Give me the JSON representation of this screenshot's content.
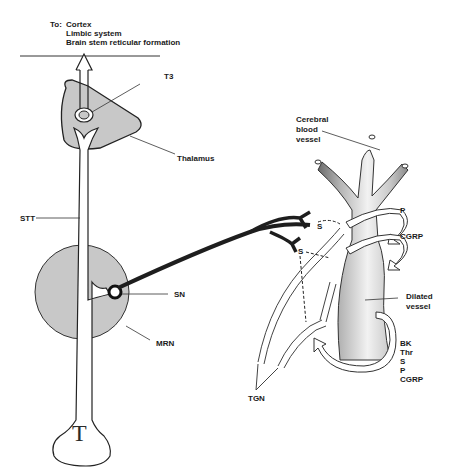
{
  "figure": {
    "destination": {
      "prefix": "To:",
      "targets": [
        "Cortex",
        "Limbic system",
        "Brain stem reticular formation"
      ]
    },
    "labels": {
      "t3": "T3",
      "thalamus": "Thalamus",
      "stt": "STT",
      "sn": "SN",
      "mrn": "MRN",
      "t_body": "T",
      "cerebral_vessel": [
        "Cerebral",
        "blood",
        "vessel"
      ],
      "p": "P",
      "cgrp": "CGRP",
      "s_upper": "S",
      "s_lower": "S",
      "dilated_vessel": [
        "Dilated",
        "vessel"
      ],
      "mediators": [
        "BK",
        "Thr",
        "S",
        "P",
        "CGRP"
      ],
      "tgn": "TGN"
    },
    "colors": {
      "nucleus_fill": "#c8c8c8",
      "stroke": "#222222",
      "vessel_shade": "#9a9a9a",
      "fiber": "#1e1e1e"
    }
  }
}
